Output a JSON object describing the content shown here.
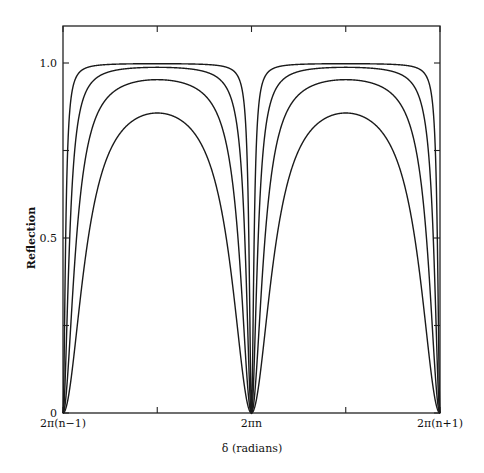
{
  "chart_data": {
    "type": "line",
    "title": "",
    "xlabel": "δ (radians)",
    "ylabel": "Reflection",
    "x_ticks": [
      {
        "pos": 0.0,
        "label": "2π(n−1)"
      },
      {
        "pos": 0.25,
        "label": ""
      },
      {
        "pos": 0.5,
        "label": "2πn"
      },
      {
        "pos": 0.75,
        "label": ""
      },
      {
        "pos": 1.0,
        "label": "2π(n+1)"
      }
    ],
    "y_ticks": [
      {
        "value": 0,
        "label": "0"
      },
      {
        "value": 0.25,
        "label": ""
      },
      {
        "value": 0.5,
        "label": "0.5"
      },
      {
        "value": 0.75,
        "label": ""
      },
      {
        "value": 1.0,
        "label": "1.0"
      }
    ],
    "xlim": [
      "2π(n−1)",
      "2π(n+1)"
    ],
    "ylim": [
      0,
      1.1
    ],
    "grid": false,
    "legend": null,
    "formula": "R = F·sin²(δ/2) / (1 + F·sin²(δ/2))",
    "series": [
      {
        "name": "curve-1",
        "coefficient_F": 500,
        "peak_value": 0.998
      },
      {
        "name": "curve-2",
        "coefficient_F": 80,
        "peak_value": 0.988
      },
      {
        "name": "curve-3",
        "coefficient_F": 20,
        "peak_value": 0.952
      },
      {
        "name": "curve-4",
        "coefficient_F": 6,
        "peak_value": 0.857
      }
    ],
    "minima_at": [
      "2π(n−1)",
      "2πn",
      "2π(n+1)"
    ],
    "minimum_value": 0
  },
  "layout": {
    "plot_left": 63,
    "plot_right": 440,
    "plot_top": 26,
    "plot_bottom": 413,
    "y_zero_px": 413,
    "y_one_px": 63
  }
}
